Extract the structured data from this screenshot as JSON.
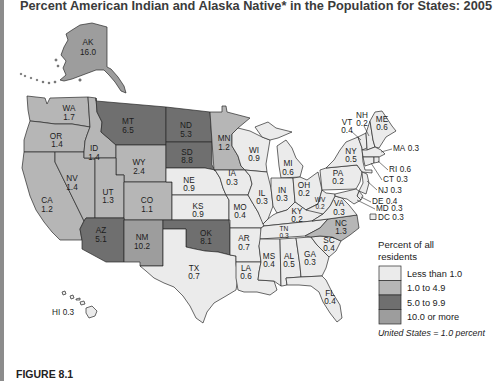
{
  "title": "Percent American Indian and Alaska Native* in the Population for States: 2005",
  "figure_label": "FIGURE 8.1",
  "map": {
    "states": [
      {
        "abbr": "AK",
        "value": "16.0",
        "category": 3
      },
      {
        "abbr": "HI",
        "value": "0.3",
        "category": 0
      },
      {
        "abbr": "WA",
        "value": "1.7",
        "category": 1
      },
      {
        "abbr": "OR",
        "value": "1.4",
        "category": 1
      },
      {
        "abbr": "CA",
        "value": "1.2",
        "category": 1
      },
      {
        "abbr": "NV",
        "value": "1.4",
        "category": 1
      },
      {
        "abbr": "ID",
        "value": "1.4",
        "category": 1
      },
      {
        "abbr": "MT",
        "value": "6.5",
        "category": 2
      },
      {
        "abbr": "WY",
        "value": "2.4",
        "category": 1
      },
      {
        "abbr": "UT",
        "value": "1.3",
        "category": 1
      },
      {
        "abbr": "CO",
        "value": "1.1",
        "category": 1
      },
      {
        "abbr": "AZ",
        "value": "5.1",
        "category": 2
      },
      {
        "abbr": "NM",
        "value": "10.2",
        "category": 3
      },
      {
        "abbr": "ND",
        "value": "5.3",
        "category": 2
      },
      {
        "abbr": "SD",
        "value": "8.8",
        "category": 2
      },
      {
        "abbr": "NE",
        "value": "0.9",
        "category": 0
      },
      {
        "abbr": "KS",
        "value": "0.9",
        "category": 0
      },
      {
        "abbr": "OK",
        "value": "8.1",
        "category": 2
      },
      {
        "abbr": "TX",
        "value": "0.7",
        "category": 0
      },
      {
        "abbr": "MN",
        "value": "1.2",
        "category": 1
      },
      {
        "abbr": "IA",
        "value": "0.3",
        "category": 0
      },
      {
        "abbr": "MO",
        "value": "0.4",
        "category": 0
      },
      {
        "abbr": "AR",
        "value": "0.7",
        "category": 0
      },
      {
        "abbr": "LA",
        "value": "0.6",
        "category": 0
      },
      {
        "abbr": "WI",
        "value": "0.9",
        "category": 0
      },
      {
        "abbr": "IL",
        "value": "0.3",
        "category": 0
      },
      {
        "abbr": "MI",
        "value": "0.6",
        "category": 0
      },
      {
        "abbr": "IN",
        "value": "0.3",
        "category": 0
      },
      {
        "abbr": "OH",
        "value": "0.2",
        "category": 0
      },
      {
        "abbr": "KY",
        "value": "0.2",
        "category": 0
      },
      {
        "abbr": "TN",
        "value": "0.3",
        "category": 0
      },
      {
        "abbr": "MS",
        "value": "0.4",
        "category": 0
      },
      {
        "abbr": "AL",
        "value": "0.5",
        "category": 0
      },
      {
        "abbr": "GA",
        "value": "0.3",
        "category": 0
      },
      {
        "abbr": "FL",
        "value": "0.4",
        "category": 0
      },
      {
        "abbr": "SC",
        "value": "0.4",
        "category": 0
      },
      {
        "abbr": "NC",
        "value": "1.3",
        "category": 1
      },
      {
        "abbr": "VA",
        "value": "0.3",
        "category": 0
      },
      {
        "abbr": "WV",
        "value": "0.2",
        "category": 0
      },
      {
        "abbr": "PA",
        "value": "0.2",
        "category": 0
      },
      {
        "abbr": "NY",
        "value": "0.5",
        "category": 0
      },
      {
        "abbr": "NJ",
        "value": "0.3",
        "category": 0
      },
      {
        "abbr": "DE",
        "value": "0.4",
        "category": 0
      },
      {
        "abbr": "MD",
        "value": "0.3",
        "category": 0
      },
      {
        "abbr": "DC",
        "value": "0.3",
        "category": 0
      },
      {
        "abbr": "VT",
        "value": "0.4",
        "category": 0
      },
      {
        "abbr": "NH",
        "value": "0.2",
        "category": 0
      },
      {
        "abbr": "ME",
        "value": "0.6",
        "category": 0
      },
      {
        "abbr": "MA",
        "value": "0.3",
        "category": 0
      },
      {
        "abbr": "CT",
        "value": "0.3",
        "category": 0
      },
      {
        "abbr": "RI",
        "value": "0.6",
        "category": 0
      }
    ]
  },
  "legend": {
    "title_line1": "Percent of all",
    "title_line2": "residents",
    "items": [
      {
        "label": "Less than 1.0",
        "color": "#ebebeb"
      },
      {
        "label": "1.0 to 4.9",
        "color": "#b6b6b6"
      },
      {
        "label": "5.0 to 9.9",
        "color": "#6f6f6f"
      },
      {
        "label": "10.0 or more",
        "color": "#9d9d9d"
      }
    ],
    "note": "United States = 1.0 percent"
  },
  "colors": {
    "left_bar": "#8c8c8c",
    "border": "#2a2a2a",
    "title_text": "#3b3b3b"
  }
}
